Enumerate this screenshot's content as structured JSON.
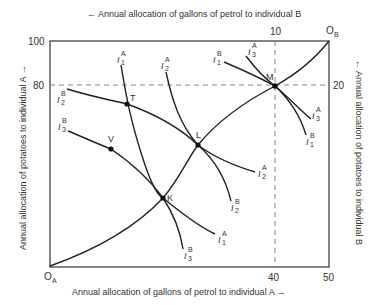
{
  "diagram": {
    "type": "edgeworth-box",
    "top_axis_label": "← Annual allocation of gallons of petrol to individual B",
    "bottom_axis_label": "Annual allocation of gallons of petrol to individual A →",
    "left_axis_label": "Annual allocation of potatoes to individual A →",
    "right_axis_label": "← Annual allocation of potatoes to individual B",
    "origin_a": "O",
    "origin_a_sub": "A",
    "origin_b": "O",
    "origin_b_sub": "B",
    "left_ticks": [
      "100",
      "80"
    ],
    "bottom_ticks": [
      "40",
      "50"
    ],
    "top_ticks": [
      "10"
    ],
    "right_ticks": [
      "20"
    ],
    "points": [
      {
        "name": "T",
        "x": 127,
        "y": 104
      },
      {
        "name": "V",
        "x": 111,
        "y": 149
      },
      {
        "name": "K",
        "x": 163,
        "y": 198
      },
      {
        "name": "L",
        "x": 198,
        "y": 145
      },
      {
        "name": "M",
        "x": 275,
        "y": 86
      }
    ],
    "curve_labels": {
      "i1a_top": {
        "base": "I",
        "sub": "1",
        "sup": "A"
      },
      "i2a_top": {
        "base": "I",
        "sub": "2",
        "sup": "A"
      },
      "i1b_top": {
        "base": "I",
        "sub": "1",
        "sup": "B"
      },
      "i3a_top": {
        "base": "I",
        "sub": "3",
        "sup": "A"
      },
      "i2b_left": {
        "base": "I",
        "sub": "2",
        "sup": "B"
      },
      "i3b_left": {
        "base": "I",
        "sub": "3",
        "sup": "B"
      },
      "i3a_right": {
        "base": "I",
        "sub": "3",
        "sup": "A"
      },
      "i1b_right": {
        "base": "I",
        "sub": "1",
        "sup": "B"
      },
      "i2a_right": {
        "base": "I",
        "sub": "2",
        "sup": "A"
      },
      "i2b_bottom": {
        "base": "I",
        "sub": "2",
        "sup": "B"
      },
      "i1a_bottom": {
        "base": "I",
        "sub": "1",
        "sup": "A"
      },
      "i3b_bottom": {
        "base": "I",
        "sub": "3",
        "sup": "B"
      }
    }
  }
}
